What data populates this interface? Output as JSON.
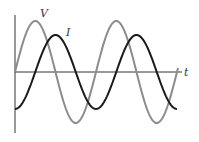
{
  "diagram": {
    "labels": {
      "voltage": "V",
      "current": "I",
      "time_axis": "t"
    },
    "colors": {
      "voltage": "#8c8c8c",
      "current": "#1a1a1a",
      "axes": "#222222",
      "background": "#ffffff"
    }
  },
  "chart_data": {
    "type": "line",
    "title": "",
    "xlabel": "t",
    "ylabel": "",
    "grid": false,
    "series": [
      {
        "name": "V",
        "shape": "sine",
        "phase": "leads by ~90°",
        "amplitude_rel": 1.0,
        "cycles_shown": 2
      },
      {
        "name": "I",
        "shape": "sine",
        "phase": "lags V by ~90°",
        "amplitude_rel": 0.73,
        "cycles_shown": 2
      }
    ]
  }
}
